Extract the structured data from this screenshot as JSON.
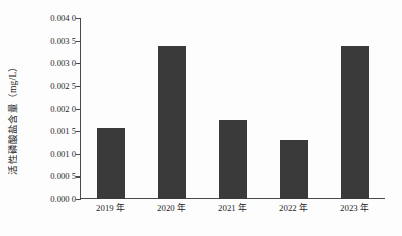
{
  "chart_data": {
    "type": "bar",
    "title": "",
    "xlabel": "",
    "ylabel": "活性磷酸盐含量（mg/L）",
    "categories": [
      "2019 年",
      "2020 年",
      "2021 年",
      "2022 年",
      "2023 年"
    ],
    "values": [
      0.00157,
      0.00339,
      0.00175,
      0.00131,
      0.00338
    ],
    "ylim": [
      0.0,
      0.004
    ],
    "ytick_values": [
      0.0,
      0.0005,
      0.001,
      0.0015,
      0.002,
      0.0025,
      0.003,
      0.0035,
      0.004
    ],
    "ytick_labels": [
      "0.000 0",
      "0.000 5",
      "0.001 0",
      "0.001 5",
      "0.002 0",
      "0.002 5",
      "0.003 0",
      "0.003 5",
      "0.004 0"
    ],
    "grid": false,
    "legend": null,
    "bar_color": "#3a3a3a",
    "axis_color": "#4a4a4a",
    "background_color": "#fdfdfd"
  }
}
